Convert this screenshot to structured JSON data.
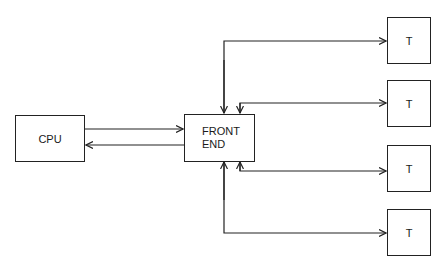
{
  "diagram": {
    "nodes": {
      "cpu": {
        "label": "CPU"
      },
      "front_end": {
        "label": "FRONT\nEND",
        "line1": "FRONT",
        "line2": "END"
      },
      "terminals": [
        {
          "label": "T"
        },
        {
          "label": "T"
        },
        {
          "label": "T"
        },
        {
          "label": "T"
        }
      ]
    },
    "edges": [
      {
        "from": "CPU",
        "to": "FRONT END",
        "direction": "right"
      },
      {
        "from": "FRONT END",
        "to": "CPU",
        "direction": "left"
      },
      {
        "from": "FRONT END",
        "to": "T1",
        "bidirectional": true
      },
      {
        "from": "FRONT END",
        "to": "T2",
        "bidirectional": true
      },
      {
        "from": "FRONT END",
        "to": "T3",
        "bidirectional": true
      },
      {
        "from": "FRONT END",
        "to": "T4",
        "bidirectional": true
      }
    ],
    "colors": {
      "stroke": "#222222",
      "background": "#ffffff"
    }
  }
}
